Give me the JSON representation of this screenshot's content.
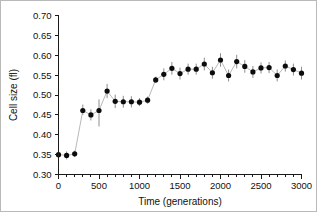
{
  "chart_data": {
    "type": "scatter",
    "title": "",
    "xlabel": "Time (generations)",
    "ylabel": "Cell size (fl)",
    "xlim": [
      0,
      3000
    ],
    "ylim": [
      0.3,
      0.7
    ],
    "xticks": [
      0,
      500,
      1000,
      1500,
      2000,
      2500,
      3000
    ],
    "xtick_labels": [
      "0",
      "500",
      "1000",
      "1500",
      "2000",
      "2500",
      "3000"
    ],
    "xtick_minor_step": 100,
    "yticks": [
      0.3,
      0.35,
      0.4,
      0.45,
      0.5,
      0.55,
      0.6,
      0.65,
      0.7
    ],
    "ytick_labels": [
      "0.30",
      "0.35",
      "0.40",
      "0.45",
      "0.50",
      "0.55",
      "0.60",
      "0.65",
      "0.70"
    ],
    "grid": false,
    "legend": null,
    "marker_style": "filled-circle",
    "errorbar_style": "vertical-line",
    "connector_line": true,
    "series": [
      {
        "name": "Cell size",
        "x": [
          0,
          100,
          200,
          300,
          400,
          500,
          600,
          700,
          800,
          900,
          1000,
          1100,
          1200,
          1300,
          1400,
          1500,
          1600,
          1700,
          1800,
          1900,
          2000,
          2100,
          2200,
          2300,
          2400,
          2500,
          2600,
          2700,
          2800,
          2900,
          3000
        ],
        "y": [
          0.35,
          0.348,
          0.352,
          0.461,
          0.45,
          0.461,
          0.51,
          0.484,
          0.483,
          0.483,
          0.482,
          0.487,
          0.538,
          0.552,
          0.567,
          0.554,
          0.565,
          0.565,
          0.578,
          0.556,
          0.588,
          0.549,
          0.584,
          0.572,
          0.558,
          0.568,
          0.569,
          0.549,
          0.573,
          0.564,
          0.555
        ],
        "yerr_low": [
          0.009,
          0.01,
          0.008,
          0.011,
          0.014,
          0.04,
          0.018,
          0.017,
          0.015,
          0.014,
          0.01,
          0.009,
          0.008,
          0.015,
          0.016,
          0.015,
          0.014,
          0.014,
          0.016,
          0.015,
          0.017,
          0.015,
          0.017,
          0.016,
          0.015,
          0.014,
          0.014,
          0.015,
          0.014,
          0.015,
          0.016
        ],
        "yerr_high": [
          0.009,
          0.01,
          0.008,
          0.015,
          0.014,
          0.028,
          0.018,
          0.017,
          0.015,
          0.014,
          0.01,
          0.009,
          0.008,
          0.015,
          0.016,
          0.015,
          0.014,
          0.014,
          0.016,
          0.015,
          0.017,
          0.015,
          0.017,
          0.016,
          0.015,
          0.014,
          0.014,
          0.015,
          0.014,
          0.015,
          0.016
        ]
      }
    ],
    "colors": {
      "marker": "#0c0c0c",
      "errorbar": "#8e8e8e",
      "axis": "#1a1a1a",
      "background": "#ffffff"
    }
  }
}
